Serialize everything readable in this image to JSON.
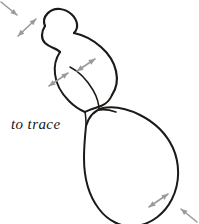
{
  "figure": {
    "caption": "to trace",
    "caption_position": {
      "x": 11,
      "y": 117
    },
    "background_color": "#ffffff",
    "outline_color": "#1c1a18",
    "arrow_color": "#9a9a9a",
    "canvas": {
      "width": 199,
      "height": 224
    }
  },
  "chart_data": {
    "type": "diagram",
    "title": "to trace",
    "outlines": [
      {
        "name": "head-lobe",
        "label": "upper rounded head lobe",
        "stroke_width": 2.2,
        "d": "M 45 26 C 41 16, 51 8, 60 9 C 69 10, 76 17, 77 24 C 77.5 28, 76 31, 74 33"
      },
      {
        "name": "head-left-flank",
        "label": "left flank of head running into neck",
        "stroke_width": 2.2,
        "d": "M 45 26 C 41 32, 41 39, 45 43 C 50 48, 57 48, 60 52"
      },
      {
        "name": "body-upper-right",
        "label": "upper right contour of mid body",
        "stroke_width": 2.2,
        "d": "M 74 33 C 84 35, 93 40, 101 47 C 109 54, 114 62, 116 71 C 118 80, 116 89, 112 95"
      },
      {
        "name": "body-left-contour",
        "label": "left contour of mid body",
        "stroke_width": 2.0,
        "d": "M 60 52 C 56 58, 54 66, 55 74 C 56 84, 62 94, 69 101 C 74 106, 80 110, 85 112"
      },
      {
        "name": "body-lower-right",
        "label": "lower right contour of mid body meeting lower lobe",
        "stroke_width": 2.0,
        "d": "M 112 95 C 110 100, 106 104, 101 106 C 96 108, 90 109, 85 112"
      },
      {
        "name": "inner-crease-upper",
        "label": "inner crease dividing mid body",
        "stroke_width": 1.5,
        "d": "M 70 67 C 78 71, 87 80, 93 90 C 97 97, 99 104, 99 110"
      },
      {
        "name": "inner-crease-lower",
        "label": "short inner crease below mid body",
        "stroke_width": 1.5,
        "d": "M 85 112 C 86 117, 86 121, 86 126"
      },
      {
        "name": "lower-lobe",
        "label": "large lower teardrop lobe",
        "stroke_width": 2.0,
        "d": "M 86 126 C 85 136, 84 147, 84 158 C 84 178, 89 196, 99 209 C 108 221, 122 228, 136 226 C 152 224, 165 213, 172 199 C 180 183, 180 164, 173 148 C 166 133, 154 122, 140 115 C 128 109, 114 106, 103 108 C 95 110, 89 116, 86 126 Z"
      },
      {
        "name": "lower-lobe-shoulder",
        "label": "shoulder seam at top of lower lobe",
        "stroke_width": 1.6,
        "d": "M 99 110 C 104 109, 110 110, 116 112"
      }
    ],
    "arrows": [
      {
        "name": "arrow-top-left-corner",
        "label": "incoming pointer to head lobe",
        "type": "single",
        "x1": 1,
        "y1": 2,
        "x2": 17,
        "y2": 15
      },
      {
        "name": "arrow-head-width",
        "label": "double arrow across head lobe",
        "type": "double",
        "x1": 18,
        "y1": 36,
        "x2": 36,
        "y2": 19
      },
      {
        "name": "arrow-mid-left",
        "label": "double arrow across left mid body",
        "type": "double",
        "x1": 49,
        "y1": 86,
        "x2": 68,
        "y2": 73
      },
      {
        "name": "arrow-mid-right",
        "label": "double arrow across right mid body",
        "type": "double",
        "x1": 77,
        "y1": 71,
        "x2": 95,
        "y2": 59
      },
      {
        "name": "arrow-lower-lobe",
        "label": "double arrow across lower lobe edge",
        "type": "double",
        "x1": 149,
        "y1": 207,
        "x2": 168,
        "y2": 194
      },
      {
        "name": "arrow-bottom-right-corner",
        "label": "incoming pointer to lower lobe edge",
        "type": "single",
        "x1": 197,
        "y1": 222,
        "x2": 181,
        "y2": 209
      }
    ]
  }
}
